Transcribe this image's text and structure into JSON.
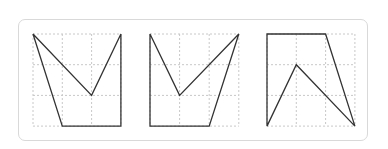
{
  "diagram": {
    "type": "grid-polygons",
    "grid": {
      "cols": 3,
      "rows": 3,
      "line_color": "#c8c8c8",
      "line_style": "dotted"
    },
    "stroke_color": "#333333",
    "figures": [
      {
        "name": "figure-1",
        "origin": [
          33,
          34
        ],
        "cell": [
          29.3,
          30.7
        ],
        "points": [
          [
            0,
            0
          ],
          [
            2,
            2
          ],
          [
            3,
            0
          ],
          [
            3,
            3
          ],
          [
            1,
            3
          ]
        ]
      },
      {
        "name": "figure-2",
        "origin": [
          150,
          34
        ],
        "cell": [
          29.6,
          30.7
        ],
        "points": [
          [
            0,
            0
          ],
          [
            1,
            2
          ],
          [
            3,
            0
          ],
          [
            2,
            3
          ],
          [
            0,
            3
          ]
        ]
      },
      {
        "name": "figure-3",
        "origin": [
          267,
          34
        ],
        "cell": [
          29.3,
          30.7
        ],
        "points": [
          [
            0,
            0
          ],
          [
            2,
            0
          ],
          [
            3,
            3
          ],
          [
            1,
            1
          ],
          [
            0,
            3
          ]
        ]
      }
    ]
  }
}
